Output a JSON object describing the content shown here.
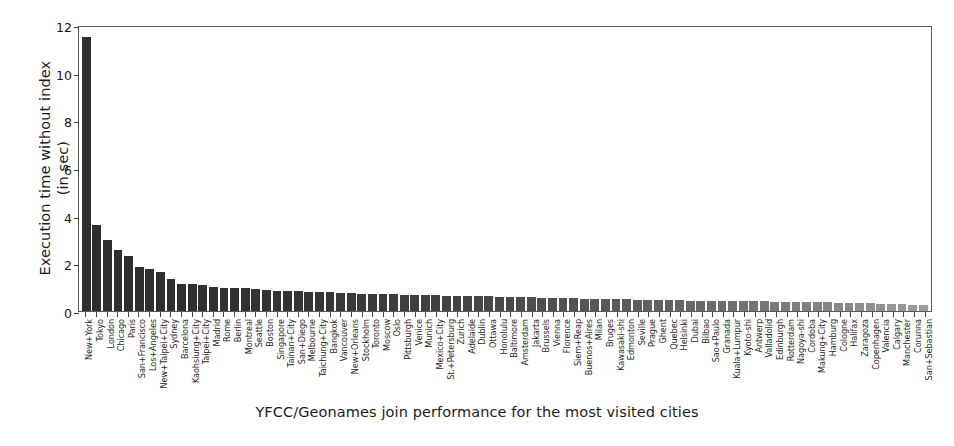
{
  "chart_data": {
    "type": "bar",
    "title": "",
    "xlabel": "YFCC/Geonames join performance for the most visited cities",
    "ylabel": "Execution time without index\n(in sec)",
    "ylim": [
      0,
      12
    ],
    "yticks": [
      0,
      2,
      4,
      6,
      8,
      10,
      12
    ],
    "grid": false,
    "legend": null,
    "bar_color": "#2e2e2e",
    "categories": [
      "New+York",
      "Tokyo",
      "London",
      "Chicago",
      "Paris",
      "San+Francisco",
      "Los+Angeles",
      "New+Taipei+City",
      "Sydney",
      "Barcelona",
      "Kaohsiung+City",
      "Taipei+City",
      "Madrid",
      "Rome",
      "Berlin",
      "Montreal",
      "Seattle",
      "Boston",
      "Singapore",
      "Tainan+City",
      "San+Diego",
      "Melbourne",
      "Taichung+City",
      "Bangkok",
      "Vancouver",
      "New+Orleans",
      "Stockholm",
      "Toronto",
      "Moscow",
      "Oslo",
      "Pittsburgh",
      "Venice",
      "Munich",
      "Mexico+City",
      "St.+Petersburg",
      "Zurich",
      "Adelaide",
      "Dublin",
      "Ottawa",
      "Honolulu",
      "Baltimore",
      "Amsterdam",
      "Jakarta",
      "Brussels",
      "Vienna",
      "Florence",
      "Siem+Reap",
      "Buenos+Aires",
      "Milan",
      "Bruges",
      "Kawasaki-shi",
      "Edmonton",
      "Seville",
      "Prague",
      "Ghent",
      "Quebec",
      "Helsinki",
      "Dubai",
      "Bilbao",
      "Sao+Paulo",
      "Granada",
      "Kuala+Lumpur",
      "Kyoto-shi",
      "Antwerp",
      "Valladolid",
      "Edinburgh",
      "Rotterdam",
      "Nagoya-shi",
      "Cordoba",
      "Makung+City",
      "Hamburg",
      "Cologne",
      "Halifax",
      "Zaragoza",
      "Copenhagen",
      "Valencia",
      "Calgary",
      "Manchester",
      "Corunna",
      "San+Sebastian"
    ],
    "values": [
      11.5,
      3.6,
      3.0,
      2.58,
      2.3,
      1.85,
      1.76,
      1.62,
      1.33,
      1.15,
      1.12,
      1.1,
      1.0,
      0.98,
      0.96,
      0.95,
      0.93,
      0.88,
      0.86,
      0.84,
      0.82,
      0.8,
      0.79,
      0.78,
      0.76,
      0.75,
      0.73,
      0.72,
      0.71,
      0.7,
      0.69,
      0.68,
      0.67,
      0.66,
      0.65,
      0.64,
      0.63,
      0.62,
      0.61,
      0.6,
      0.59,
      0.58,
      0.57,
      0.56,
      0.55,
      0.54,
      0.53,
      0.52,
      0.51,
      0.5,
      0.5,
      0.49,
      0.48,
      0.47,
      0.46,
      0.46,
      0.45,
      0.44,
      0.44,
      0.43,
      0.42,
      0.42,
      0.41,
      0.4,
      0.4,
      0.39,
      0.38,
      0.38,
      0.37,
      0.36,
      0.36,
      0.35,
      0.34,
      0.33,
      0.32,
      0.31,
      0.3,
      0.28,
      0.26,
      0.24
    ]
  }
}
